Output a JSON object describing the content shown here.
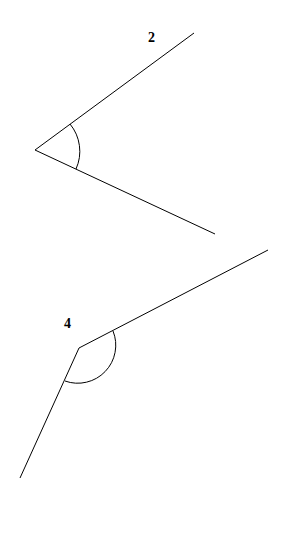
{
  "diagram": {
    "angles": [
      {
        "label": "2",
        "vertex": [
          35,
          150
        ],
        "ray1_end": [
          194,
          33
        ],
        "ray2_end": [
          215,
          234
        ],
        "arc_radius": 42,
        "label_pos": [
          152,
          42
        ]
      },
      {
        "label": "4",
        "vertex": [
          79,
          348
        ],
        "ray1_end": [
          268,
          250
        ],
        "ray2_end": [
          20,
          478
        ],
        "arc_radius": 38,
        "label_pos": [
          68,
          328
        ]
      }
    ],
    "stroke_color": "#000000",
    "background": "#ffffff"
  }
}
